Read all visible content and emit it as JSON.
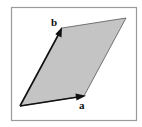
{
  "figure": {
    "frame": {
      "x": 11,
      "y": 7,
      "width": 125,
      "height": 113,
      "stroke": "#9a9a9a"
    },
    "fill_color": "#c4c4c4",
    "vector_color": "#111111",
    "vertices": {
      "origin": [
        20,
        106
      ],
      "a_tip": [
        84,
        96
      ],
      "b_tip": [
        62,
        28
      ],
      "a_plus_b": [
        126,
        18
      ]
    },
    "vectors": [
      {
        "name": "a",
        "label": "a",
        "from": [
          20,
          106
        ],
        "to": [
          84,
          96
        ],
        "label_pos": [
          79,
          109
        ]
      },
      {
        "name": "b",
        "label": "b",
        "from": [
          20,
          106
        ],
        "to": [
          62,
          28
        ],
        "label_pos": [
          52,
          25
        ]
      }
    ]
  }
}
